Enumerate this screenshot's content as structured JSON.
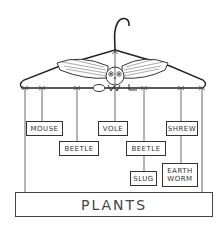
{
  "diagram": {
    "hanger_label": "OWL",
    "apex": {
      "name": "OWL"
    },
    "nodes": [
      {
        "id": "mouse",
        "label": "MOUSE",
        "x": 26,
        "y": 121,
        "w": 37,
        "h": 15
      },
      {
        "id": "vole",
        "label": "VOLE",
        "x": 98,
        "y": 121,
        "w": 30,
        "h": 15
      },
      {
        "id": "shrew",
        "label": "SHREW",
        "x": 166,
        "y": 121,
        "w": 32,
        "h": 15
      },
      {
        "id": "beetle_left",
        "label": "BEETLE",
        "x": 59,
        "y": 141,
        "w": 40,
        "h": 15
      },
      {
        "id": "beetle_right",
        "label": "BEETLE",
        "x": 126,
        "y": 141,
        "w": 40,
        "h": 15
      },
      {
        "id": "slug",
        "label": "SLUG",
        "x": 130,
        "y": 171,
        "w": 27,
        "h": 15
      },
      {
        "id": "earthworm",
        "label": "EARTH WORM",
        "x": 162,
        "y": 163,
        "w": 36,
        "h": 24
      }
    ],
    "base": {
      "label": "PLANTS"
    },
    "edges": [
      [
        "OWL",
        "MOUSE"
      ],
      [
        "OWL",
        "BEETLE"
      ],
      [
        "OWL",
        "VOLE"
      ],
      [
        "OWL",
        "BEETLE"
      ],
      [
        "OWL",
        "SHREW"
      ],
      [
        "BEETLE",
        "SLUG"
      ],
      [
        "SHREW",
        "EARTH WORM"
      ],
      [
        "OWL",
        "PLANTS"
      ]
    ],
    "colors": {
      "line": "#333333",
      "background": "#ffffff"
    }
  }
}
